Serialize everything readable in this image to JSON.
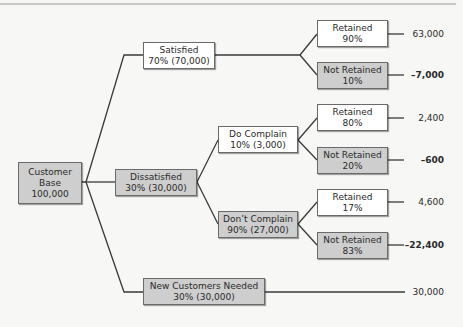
{
  "diagram": {
    "type": "decision-tree",
    "root": {
      "line1": "Customer",
      "line2": "Base",
      "line3": "100,000"
    },
    "satisfied": {
      "label": "Satisfied",
      "detail": "70% (70,000)",
      "retained": {
        "label": "Retained",
        "pct": "90%",
        "value": "63,000"
      },
      "not_retained": {
        "label": "Not Retained",
        "pct": "10%",
        "value": "–7,000"
      }
    },
    "dissatisfied": {
      "label": "Dissatisfied",
      "detail": "30% (30,000)",
      "do_complain": {
        "label": "Do Complain",
        "detail": "10% (3,000)",
        "retained": {
          "label": "Retained",
          "pct": "80%",
          "value": "2,400"
        },
        "not_retained": {
          "label": "Not Retained",
          "pct": "20%",
          "value": "–600"
        }
      },
      "dont_complain": {
        "label": "Don’t Complain",
        "detail": "90% (27,000)",
        "retained": {
          "label": "Retained",
          "pct": "17%",
          "value": "4,600"
        },
        "not_retained": {
          "label": "Not Retained",
          "pct": "83%",
          "value": "–22,400"
        }
      }
    },
    "new_customers": {
      "label": "New Customers Needed",
      "detail": "30% (30,000)",
      "value": "30,000"
    },
    "colors": {
      "gray_fill": "#cecece",
      "white_fill": "#ffffff",
      "line": "#3a3a3a"
    }
  }
}
